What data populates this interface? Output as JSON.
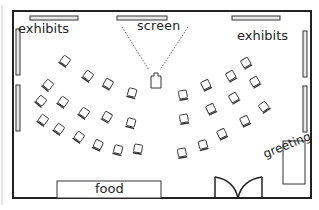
{
  "diagram": {
    "type": "floor-plan",
    "labels": {
      "exhibits_left": "exhibits",
      "exhibits_right": "exhibits",
      "screen": "screen",
      "food": "food",
      "greeting": "greeting"
    },
    "colors": {
      "wall": "#222222",
      "fixture_fill": "#e8e8e8",
      "chair_fill": "#ffffff",
      "text": "#222222"
    },
    "chair_count": 32
  }
}
